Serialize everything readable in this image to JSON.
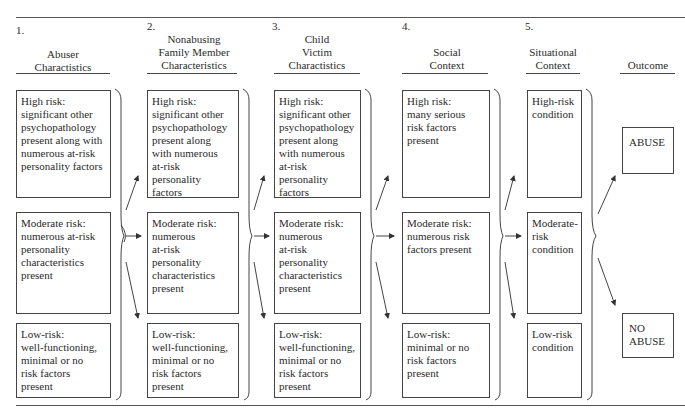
{
  "diagram": {
    "columns": [
      {
        "number": "1.",
        "title": "Abuser\nCharactistics",
        "boxes": [
          "High risk:\nsignificant other\npsychopathology\npresent along with\nnumerous at-risk\npersonality factors",
          "Moderate risk:\nnumerous at-risk\npersonality\ncharacteristics\npresent",
          "Low-risk:\nwell-functioning,\nminimal or no\nrisk factors\npresent"
        ]
      },
      {
        "number": "2.",
        "title": "Nonabusing\nFamily Member\nCharacteristics",
        "boxes": [
          "High risk:\nsignificant other\npsychopathology\npresent along\nwith numerous\nat-risk\npersonality\nfactors",
          "Moderate risk:\nnumerous\nat-risk\npersonality\ncharacteristics\npresent",
          "Low-risk:\nwell-functioning,\nminimal or no\nrisk factors\npresent"
        ]
      },
      {
        "number": "3.",
        "title": "Child\nVictim\nCharactistics",
        "boxes": [
          "High risk:\nsignificant other\npsychopathology\npresent along\nwith numerous\nat-risk\npersonality\nfactors",
          "Moderate risk:\nnumerous\nat-risk\npersonality\ncharacteristics\npresent",
          "Low-risk:\nwell-functioning,\nminimal or no\nrisk factors\npresent"
        ]
      },
      {
        "number": "4.",
        "title": "Social\nContext",
        "boxes": [
          "High risk:\nmany serious\nrisk factors\npresent",
          "Moderate risk:\nnumerous risk\nfactors present",
          "Low-risk:\nminimal or no\nrisk factors\npresent"
        ]
      },
      {
        "number": "5.",
        "title": "Situational\nContext",
        "boxes": [
          "High-risk\ncondition",
          "Moderate-\nrisk\ncondition",
          "Low-risk\ncondition"
        ]
      }
    ],
    "outcome": {
      "title": "Outcome",
      "boxes": [
        "ABUSE",
        "NO\nABUSE"
      ]
    }
  }
}
